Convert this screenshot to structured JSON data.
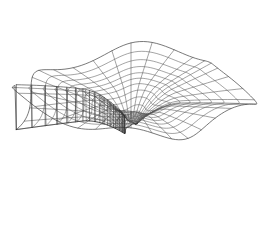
{
  "figure": {
    "title": "Riemann surface wireframe",
    "kind": "3d-wireframe-surface",
    "background_color": "#ffffff",
    "line_color": "#555555",
    "boundary_line_color": "#3f3f3f",
    "ridge_line_color": "#2c2c2c",
    "line_width": 0.55,
    "canvas_width": 262,
    "canvas_height": 234,
    "has_axes": false,
    "has_labels": false,
    "has_legend": false,
    "has_title_text": false
  },
  "chart_data": {
    "type": "surface",
    "title": "",
    "subtitle": "",
    "xlabel": "",
    "ylabel": "",
    "zlabel": "",
    "legend": [],
    "annotations": [],
    "grid": true,
    "surface_function": "multivalued-complex-log-riemann-sheet",
    "mesh_kind": "polar",
    "radial_spokes": 36,
    "rings": 14,
    "sheets": 1,
    "turns": 1.0,
    "branch_cut_angle_deg": 150,
    "r_min": 0.055,
    "r_max": 1.0,
    "r_spacing": "logarithmic",
    "z_ramp_amplitude": 0.62,
    "z_wave_amplitude": 0.1,
    "z_wave_lobes": 6,
    "projection": {
      "type": "oblique-orthographic",
      "elevation_deg": 30,
      "azimuth_deg": 20,
      "x_scale": 115,
      "y_scale": 62,
      "z_scale": 72,
      "center_x": 131,
      "center_y": 116
    },
    "branch_point_screen_positions": [
      {
        "label": "upper-branch-node",
        "x": 133,
        "y": 83
      },
      {
        "label": "lower-branch-node",
        "x": 131,
        "y": 147
      }
    ],
    "bounds_screen": {
      "left": 17,
      "right": 245,
      "top": 18,
      "bottom": 222
    },
    "ring_radii_normalized": [
      0.055,
      0.075,
      0.101,
      0.137,
      0.185,
      0.25,
      0.315,
      0.39,
      0.47,
      0.55,
      0.64,
      0.74,
      0.86,
      1.0
    ],
    "spoke_angles_deg": [
      0,
      10,
      20,
      30,
      40,
      50,
      60,
      70,
      80,
      90,
      100,
      110,
      120,
      130,
      140,
      150,
      160,
      170,
      180,
      190,
      200,
      210,
      220,
      230,
      240,
      250,
      260,
      270,
      280,
      290,
      300,
      310,
      320,
      330,
      340,
      350
    ]
  }
}
